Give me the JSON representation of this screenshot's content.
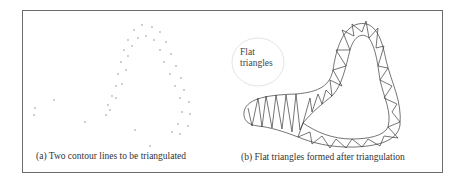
{
  "figure": {
    "panel_a": {
      "caption": "(a) Two contour lines to be triangulated"
    },
    "panel_b": {
      "caption": "(b) Flat triangles formed after triangulation",
      "annotation_line1": "Flat",
      "annotation_line2": "triangles"
    },
    "colors": {
      "border": "#6b6b6b",
      "dots": "#b5b5b5",
      "mesh": "#333333"
    }
  }
}
